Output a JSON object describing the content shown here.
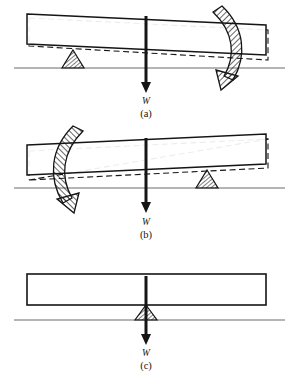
{
  "figure": {
    "width": 293,
    "height": 371,
    "background_color": "#ffffff",
    "ink_color": "#151515",
    "ground_color": "#6b6b6b",
    "hatch_color": "#151515"
  },
  "panels": [
    {
      "id": "a",
      "caption": "(a)",
      "load_label": "W",
      "description": "Beam tilted clockwise, fulcrum left of load, rotation arrow on right",
      "fulcrum_side": "left",
      "tilt_direction": "clockwise",
      "arrow_side": "right",
      "arrow_direction": "clockwise",
      "beam": {
        "left_x": 27,
        "right_x": 266,
        "top_left_y": 14,
        "top_right_y": 25,
        "bottom_left_y": 44,
        "bottom_right_y": 55
      },
      "ghost_beam": {
        "style": "dashed",
        "left_x": 29,
        "right_x": 268,
        "top_left_y": 18,
        "top_right_y": 30,
        "bottom_left_y": 46,
        "bottom_right_y": 60
      },
      "ground_y": 68,
      "ground_x1": 14,
      "ground_x2": 285,
      "fulcrum_x": 73,
      "fulcrum_half_width": 11,
      "fulcrum_height": 18,
      "load_x": 146,
      "load_arrow_top_y": 16,
      "load_arrow_bottom_y": 92,
      "load_label_y": 104,
      "caption_y": 117
    },
    {
      "id": "b",
      "caption": "(b)",
      "load_label": "W",
      "description": "Beam tilted counter-clockwise, fulcrum right of load, rotation arrow on left",
      "fulcrum_side": "right",
      "tilt_direction": "counter-clockwise",
      "arrow_side": "left",
      "arrow_direction": "counter-clockwise",
      "beam": {
        "left_x": 27,
        "right_x": 266,
        "top_left_y": 145,
        "top_right_y": 134,
        "bottom_left_y": 175,
        "bottom_right_y": 164
      },
      "ghost_beam": {
        "style": "dashed",
        "left_x": 29,
        "right_x": 268,
        "top_left_y": 151,
        "top_right_y": 139,
        "bottom_left_y": 180,
        "bottom_right_y": 168
      },
      "ground_y": 188,
      "ground_x1": 14,
      "ground_x2": 285,
      "fulcrum_x": 207,
      "fulcrum_half_width": 11,
      "fulcrum_height": 18,
      "load_x": 146,
      "load_arrow_top_y": 138,
      "load_arrow_bottom_y": 212,
      "load_label_y": 225,
      "caption_y": 238
    },
    {
      "id": "c",
      "caption": "(c)",
      "load_label": "W",
      "description": "Beam level and balanced, fulcrum directly under the load, no rotation arrow",
      "fulcrum_side": "center",
      "tilt_direction": "none",
      "arrow_side": "none",
      "arrow_direction": "none",
      "beam": {
        "left_x": 27,
        "right_x": 266,
        "top_left_y": 274,
        "top_right_y": 274,
        "bottom_left_y": 305,
        "bottom_right_y": 305
      },
      "ghost_beam": null,
      "ground_y": 320,
      "ground_x1": 14,
      "ground_x2": 285,
      "fulcrum_x": 146,
      "fulcrum_half_width": 11,
      "fulcrum_height": 18,
      "load_x": 146,
      "load_arrow_top_y": 276,
      "load_arrow_bottom_y": 344,
      "load_label_y": 356,
      "caption_y": 369
    }
  ]
}
